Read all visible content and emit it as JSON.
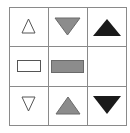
{
  "puzzle": {
    "type": "3x3 matrix",
    "colors": {
      "outline": "#555555",
      "white": "#ffffff",
      "gray": "#8c8c8c",
      "black": "#1a1a1a",
      "grid": "#8a8a8a"
    },
    "cells": [
      {
        "row": 1,
        "col": 1,
        "shape": "triangle-up",
        "fill": "white",
        "size": "small"
      },
      {
        "row": 1,
        "col": 2,
        "shape": "triangle-down",
        "fill": "gray",
        "size": "large"
      },
      {
        "row": 1,
        "col": 3,
        "shape": "triangle-up",
        "fill": "black",
        "size": "large"
      },
      {
        "row": 2,
        "col": 1,
        "shape": "rectangle",
        "fill": "white",
        "size": "small"
      },
      {
        "row": 2,
        "col": 2,
        "shape": "rectangle",
        "fill": "gray",
        "size": "large"
      },
      {
        "row": 2,
        "col": 3,
        "shape": "empty",
        "fill": "none",
        "size": "none"
      },
      {
        "row": 3,
        "col": 1,
        "shape": "triangle-down",
        "fill": "white",
        "size": "small"
      },
      {
        "row": 3,
        "col": 2,
        "shape": "triangle-up",
        "fill": "gray",
        "size": "large"
      },
      {
        "row": 3,
        "col": 3,
        "shape": "triangle-down",
        "fill": "black",
        "size": "large"
      }
    ]
  }
}
